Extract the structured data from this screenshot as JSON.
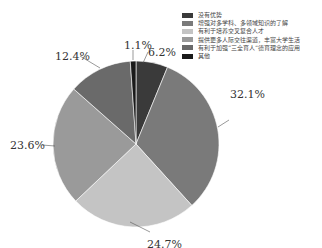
{
  "chart_data": {
    "type": "pie",
    "title": "",
    "categories": [
      "没有优势",
      "增强对多学科、多领域知识的了解",
      "有利于培养交叉复合人才",
      "提供更多人际交往渠道，丰富大学生活",
      "有利于加强“三全育人”德育理念的应用",
      "其他"
    ],
    "values": [
      6.2,
      32.1,
      24.7,
      23.6,
      12.4,
      1.1
    ],
    "labels": [
      "6.2%",
      "32.1%",
      "24.7%",
      "23.6%",
      "12.4%",
      "1.1%"
    ],
    "colors": [
      "#3a3a3a",
      "#7a7a7a",
      "#c4c4c4",
      "#9a9a9a",
      "#6a6a6a",
      "#1a1a1a"
    ],
    "legend_position": "top-right",
    "start_angle": "top, clockwise; 其他 slice sits just left of 12 o'clock"
  }
}
